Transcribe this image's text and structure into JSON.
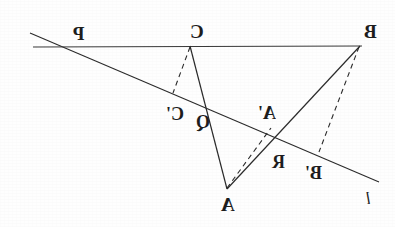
{
  "figure": {
    "background_color": "#fefefe",
    "stroke_color": "#2b2b2b",
    "mirrored": true,
    "width": 395,
    "height": 227,
    "labels": [
      {
        "id": "P",
        "text": "P",
        "x": 73,
        "y": 24,
        "style": "lbl-big"
      },
      {
        "id": "C",
        "text": "C",
        "x": 190,
        "y": 22,
        "style": "lbl-big"
      },
      {
        "id": "B",
        "text": "B",
        "x": 364,
        "y": 22,
        "style": "lbl-big"
      },
      {
        "id": "Cp",
        "text": "C'",
        "x": 166,
        "y": 105,
        "style": "lbl-prime"
      },
      {
        "id": "Q",
        "text": "Q",
        "x": 196,
        "y": 113,
        "style": "lbl-prime"
      },
      {
        "id": "Ap",
        "text": "A'",
        "x": 258,
        "y": 104,
        "style": "lbl-prime"
      },
      {
        "id": "R",
        "text": "R",
        "x": 272,
        "y": 153,
        "style": "lbl-prime"
      },
      {
        "id": "Bp",
        "text": "B'",
        "x": 305,
        "y": 164,
        "style": "lbl-prime"
      },
      {
        "id": "A",
        "text": "A",
        "x": 221,
        "y": 195,
        "style": "lbl-big"
      },
      {
        "id": "l",
        "text": "l",
        "x": 366,
        "y": 190,
        "style": "lbl-line"
      }
    ],
    "points": {
      "P": [
        73,
        47
      ],
      "C": [
        190,
        46
      ],
      "B": [
        360,
        46
      ],
      "A": [
        227,
        189
      ],
      "Cprime": [
        173,
        93
      ],
      "Aprime": [
        271,
        128
      ],
      "Bprime": [
        319,
        152
      ],
      "Q": [
        208,
        113
      ],
      "R": [
        278,
        145
      ],
      "line_l_start": [
        30,
        33
      ],
      "line_l_end": [
        379,
        182
      ],
      "h_line_start": [
        33,
        47
      ],
      "h_line_end": [
        362,
        46
      ]
    },
    "segments": [
      {
        "name": "line-l",
        "from": "line_l_start",
        "to": "line_l_end",
        "dashed": false
      },
      {
        "name": "horizontal-line-PCB",
        "from": "h_line_start",
        "to": "h_line_end",
        "dashed": false
      },
      {
        "name": "segment-CA",
        "from": "C",
        "to": "A",
        "dashed": false
      },
      {
        "name": "segment-BA",
        "from": "B",
        "to": "A",
        "dashed": false
      },
      {
        "name": "segment-C-Cprime",
        "from": "C",
        "to": "Cprime",
        "dashed": true
      },
      {
        "name": "segment-A-Aprime",
        "from": "A",
        "to": "Aprime",
        "dashed": true
      },
      {
        "name": "segment-B-Bprime",
        "from": "B",
        "to": "Bprime",
        "dashed": true
      }
    ]
  }
}
